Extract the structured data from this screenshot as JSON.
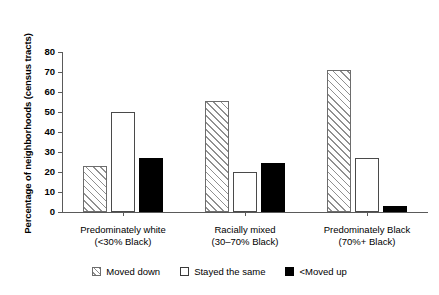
{
  "chart_data": {
    "type": "bar",
    "title": "",
    "xlabel": "",
    "ylabel": "Percentage of neighborhoods (census tracts)",
    "ylim": [
      0,
      80
    ],
    "ytick_values": [
      0,
      10,
      20,
      30,
      40,
      50,
      60,
      70,
      80
    ],
    "ytick_labels": [
      "0",
      "10",
      "20",
      "30",
      "40",
      "50",
      "60",
      "70",
      "80"
    ],
    "grid": false,
    "legend_position": "bottom",
    "categories": [
      {
        "line1": "Predominately white",
        "line2": "(<30% Black)"
      },
      {
        "line1": "Racially mixed",
        "line2": "(30–70% Black)"
      },
      {
        "line1": "Predominately Black",
        "line2": "(70%+ Black)"
      }
    ],
    "series": [
      {
        "name": "Moved down",
        "style": "hatched",
        "values": [
          23,
          55.5,
          71
        ]
      },
      {
        "name": "Stayed the same",
        "style": "white",
        "values": [
          50,
          20,
          27
        ]
      },
      {
        "name": "<Moved up",
        "style": "black",
        "values": [
          27,
          24.5,
          3
        ]
      }
    ]
  },
  "legend": {
    "items": [
      {
        "label": "Moved down",
        "swatch": "hatched-swatch"
      },
      {
        "label": "Stayed the same",
        "swatch": "white-swatch"
      },
      {
        "label": "<Moved up",
        "swatch": "black-swatch"
      }
    ]
  },
  "colors": {
    "axis": "#5a5a5a",
    "hatch_fill": "#d8d8d8",
    "hatch_line": "#909090",
    "bar_white": "#ffffff",
    "bar_black": "#000000",
    "text": "#000000",
    "background": "#ffffff"
  }
}
